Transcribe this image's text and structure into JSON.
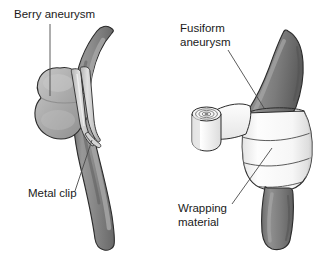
{
  "figure": {
    "background_color": "#ffffff",
    "width": 316,
    "height": 258
  },
  "colors": {
    "vessel_dark": "#7a7a7a",
    "vessel_dark_shade": "#636363",
    "vessel_highlight": "#9a9a9a",
    "aneurysm_fill": "#a8a8a8",
    "aneurysm_highlight": "#bdbdbd",
    "clip_fill": "#c9c9c9",
    "clip_highlight": "#dedede",
    "wrap_fill": "#fbfbfb",
    "wrap_shade": "#ebebeb",
    "outline": "#2b2b2b",
    "leader_line": "#4a4a4a",
    "text": "#1a1a1a"
  },
  "panels": [
    {
      "id": "left-panel",
      "name": "berry-aneurysm-clipping",
      "labels": [
        {
          "id": "berry-aneurysm",
          "text": "Berry aneurysm",
          "x": 14,
          "y": 18,
          "leader": {
            "x1": 50,
            "y1": 24,
            "x2": 50,
            "y2": 96
          }
        },
        {
          "id": "metal-clip",
          "text": "Metal clip",
          "x": 28,
          "y": 197,
          "leader": {
            "x1": 75,
            "y1": 191,
            "x2": 92,
            "y2": 140
          }
        }
      ]
    },
    {
      "id": "right-panel",
      "name": "fusiform-aneurysm-wrapping",
      "labels": [
        {
          "id": "fusiform-aneurysm",
          "text_line1": "Fusiform",
          "text_line2": "aneurysm",
          "x": 180,
          "y": 32,
          "line_height": 14,
          "leader": {
            "x1": 228,
            "y1": 50,
            "x2": 264,
            "y2": 108
          }
        },
        {
          "id": "wrapping-material",
          "text_line1": "Wrapping",
          "text_line2": "material",
          "x": 178,
          "y": 212,
          "line_height": 14,
          "leader": {
            "x1": 232,
            "y1": 204,
            "x2": 272,
            "y2": 148
          }
        }
      ]
    }
  ],
  "shapes": {
    "left": {
      "vessel_label": "cerebral-artery",
      "aneurysm_label": "berry-aneurysm-sac",
      "clip_label": "metal-clip"
    },
    "right": {
      "vessel_label": "cerebral-artery",
      "aneurysm_label": "fusiform-aneurysm-bulge",
      "wrap_label": "wrapping-material-gauze",
      "roll_label": "wrapping-material-roll"
    }
  }
}
